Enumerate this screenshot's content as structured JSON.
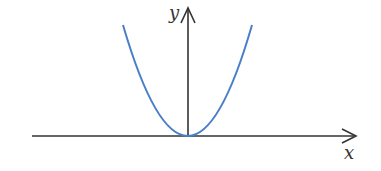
{
  "diagram": {
    "x_label": "x",
    "y_label": "y",
    "curve_color": "#4a7fc8",
    "axis_color": "#333333"
  }
}
